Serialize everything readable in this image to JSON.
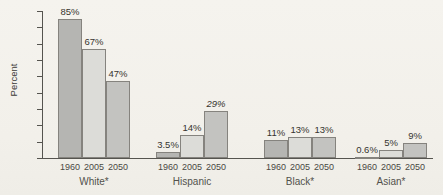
{
  "figure": {
    "background": "#f3f1ec",
    "axis_color": "#55544f",
    "text_color": "#3b3a37"
  },
  "chart_data": {
    "type": "bar",
    "title": "",
    "xlabel": "",
    "ylabel": "Percent",
    "ylim": [
      0,
      90
    ],
    "yticks": [
      0,
      10,
      20,
      30,
      40,
      50,
      60,
      70,
      80,
      90
    ],
    "grid": false,
    "legend_position": "none",
    "categories": [
      "White*",
      "Hispanic",
      "Black*",
      "Asian*"
    ],
    "group_years": [
      "1960",
      "2005",
      "2050"
    ],
    "series": [
      {
        "name": "1960",
        "color": "#b5b5b2",
        "values": [
          85,
          3.5,
          11,
          0.6
        ],
        "labels": [
          "85%",
          "3.5%",
          "11%",
          "0.6%"
        ]
      },
      {
        "name": "2005",
        "color": "#dcdcd8",
        "values": [
          67,
          14,
          13,
          5
        ],
        "labels": [
          "67%",
          "14%",
          "13%",
          "5%"
        ]
      },
      {
        "name": "2050",
        "color": "#c3c3c0",
        "values": [
          47,
          29,
          13,
          9
        ],
        "labels": [
          "47%",
          "29%",
          "13%",
          "9%"
        ]
      }
    ],
    "italic_value_labels": [
      "29%"
    ],
    "bar_border_color": "#85837e"
  }
}
